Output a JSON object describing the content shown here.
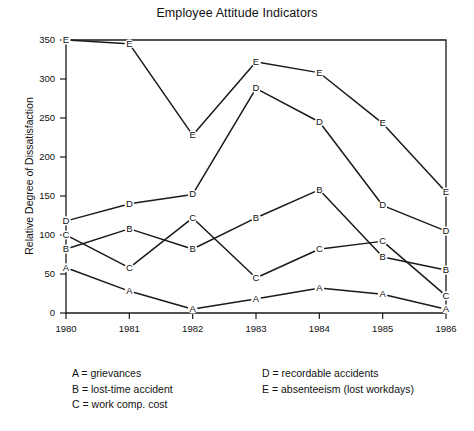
{
  "chart_data": {
    "type": "line",
    "title": "Employee Attitude Indicators",
    "xlabel": "",
    "ylabel": "Relative Degree of Dissatisfaction",
    "x": [
      "1980",
      "1981",
      "1982",
      "1983",
      "1984",
      "1985",
      "1986"
    ],
    "xlim": [
      1980,
      1986
    ],
    "ylim": [
      0,
      350
    ],
    "yticks": [
      0,
      50,
      100,
      150,
      200,
      250,
      300,
      350
    ],
    "grid": false,
    "legend_position": "below-plot",
    "marker_style": "letter-label",
    "series": [
      {
        "name": "A",
        "label": "grievances",
        "values": [
          58,
          28,
          5,
          18,
          32,
          24,
          5
        ]
      },
      {
        "name": "B",
        "label": "lost-time accident",
        "values": [
          82,
          108,
          82,
          122,
          158,
          72,
          55
        ]
      },
      {
        "name": "C",
        "label": "work comp. cost",
        "values": [
          100,
          58,
          122,
          45,
          82,
          92,
          22
        ]
      },
      {
        "name": "D",
        "label": "recordable accidents",
        "values": [
          118,
          140,
          152,
          288,
          245,
          138,
          105
        ]
      },
      {
        "name": "E",
        "label": "absenteeism (lost workdays)",
        "values": [
          350,
          345,
          228,
          322,
          308,
          243,
          155
        ]
      }
    ]
  },
  "legend": {
    "left_column": [
      "A = grievances",
      "B = lost-time accident",
      "C = work comp. cost"
    ],
    "right_column": [
      "D = recordable accidents",
      "E = absenteeism (lost workdays)"
    ]
  },
  "colors": {
    "ink": "#1a1a1a",
    "background": "#ffffff"
  }
}
